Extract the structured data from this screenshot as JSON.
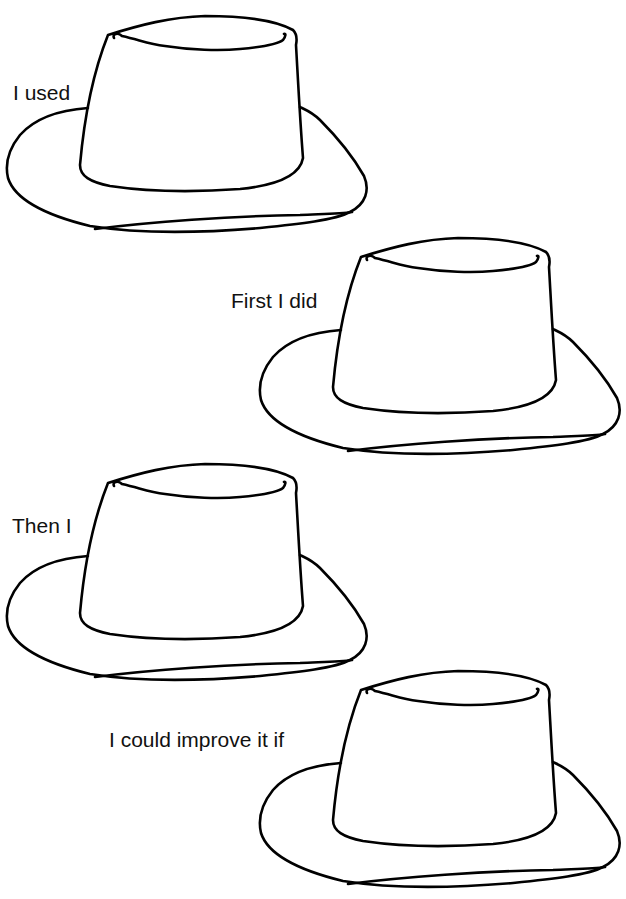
{
  "worksheet": {
    "hats": [
      {
        "prompt": "I used",
        "hat_left": 0,
        "hat_top": 0,
        "label_left": 13,
        "label_top": 82
      },
      {
        "prompt": "First I did",
        "hat_left": 253,
        "hat_top": 222,
        "label_left": 231,
        "label_top": 290
      },
      {
        "prompt": "Then I",
        "hat_left": 0,
        "hat_top": 448,
        "label_left": 12,
        "label_top": 515
      },
      {
        "prompt": "I could improve it if",
        "hat_left": 253,
        "hat_top": 655,
        "label_left": 109,
        "label_top": 729
      }
    ],
    "stroke_color": "#000000",
    "background_color": "#ffffff"
  }
}
